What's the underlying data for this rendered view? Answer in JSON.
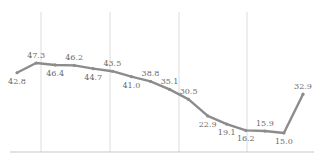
{
  "chart_data": {
    "type": "line",
    "title": "",
    "xlabel": "",
    "ylabel": "",
    "categories": [
      "1",
      "2",
      "3",
      "4",
      "5",
      "6",
      "7",
      "8",
      "9",
      "10",
      "11",
      "12",
      "13",
      "14",
      "15",
      "16"
    ],
    "series": [
      {
        "name": "series-1",
        "color": "#8c8c8c",
        "values": [
          42.8,
          47.3,
          46.4,
          46.2,
          44.7,
          43.5,
          41.0,
          38.8,
          35.1,
          30.5,
          22.9,
          19.1,
          16.2,
          15.9,
          15.0,
          32.9
        ],
        "label_positions": [
          "below",
          "above",
          "below",
          "above",
          "below",
          "above",
          "below",
          "above",
          "above",
          "above",
          "below",
          "below",
          "below",
          "above",
          "below",
          "above"
        ]
      }
    ],
    "ylim": [
      0,
      60
    ],
    "grid": {
      "vertical": true,
      "horizontal": false
    },
    "legend": "none"
  }
}
